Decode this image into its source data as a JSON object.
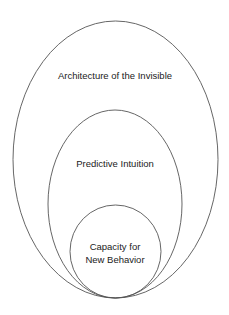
{
  "diagram": {
    "type": "nested-ellipses",
    "stroke_color": "#555555",
    "background": "#ffffff",
    "layers": [
      {
        "id": "outer",
        "label_lines": [
          "Architecture of the Invisible"
        ]
      },
      {
        "id": "middle",
        "label_lines": [
          "Predictive Intuition"
        ]
      },
      {
        "id": "inner",
        "label_lines": [
          "Capacity for",
          "New Behavior"
        ]
      }
    ]
  }
}
